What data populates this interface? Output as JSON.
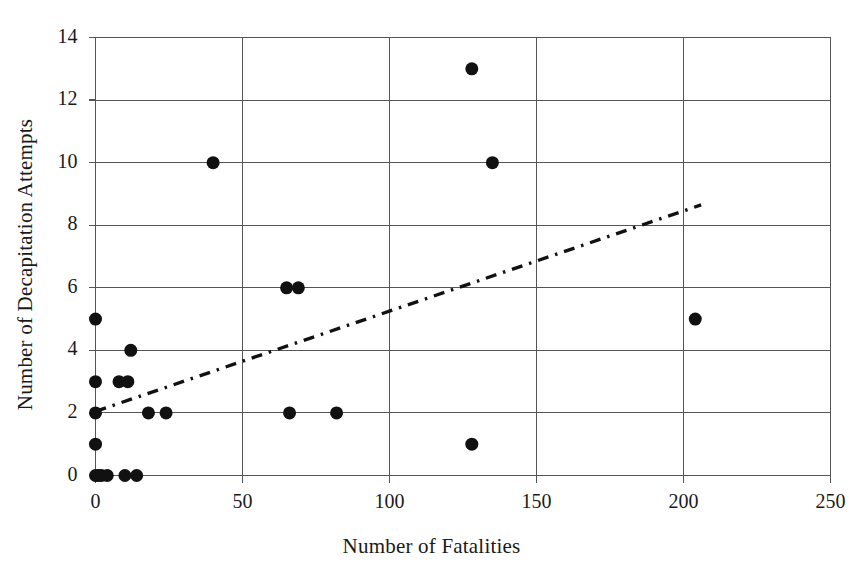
{
  "chart_data": {
    "type": "scatter",
    "title": "",
    "xlabel": "Number of Fatalities",
    "ylabel": "Number of Decapitation Attempts",
    "xlim": [
      0,
      250
    ],
    "ylim": [
      0,
      14
    ],
    "xticks": [
      0,
      50,
      100,
      150,
      200,
      250
    ],
    "yticks": [
      0,
      2,
      4,
      6,
      8,
      10,
      12,
      14
    ],
    "xtick_labels": [
      "0",
      "50",
      "100",
      "150",
      "200",
      "250"
    ],
    "ytick_labels": [
      "0",
      "2",
      "4",
      "6",
      "8",
      "10",
      "12",
      "14"
    ],
    "grid": true,
    "grid_color": "#555555",
    "legend": "none",
    "marker": {
      "shape": "circle",
      "color": "#111111",
      "size_px": 13
    },
    "points": [
      {
        "x": 0,
        "y": 0
      },
      {
        "x": 1,
        "y": 0
      },
      {
        "x": 2,
        "y": 0
      },
      {
        "x": 4,
        "y": 0
      },
      {
        "x": 10,
        "y": 0
      },
      {
        "x": 14,
        "y": 0
      },
      {
        "x": 0,
        "y": 1
      },
      {
        "x": 0,
        "y": 2
      },
      {
        "x": 0,
        "y": 3
      },
      {
        "x": 0,
        "y": 5
      },
      {
        "x": 8,
        "y": 3
      },
      {
        "x": 11,
        "y": 3
      },
      {
        "x": 12,
        "y": 4
      },
      {
        "x": 18,
        "y": 2
      },
      {
        "x": 24,
        "y": 2
      },
      {
        "x": 40,
        "y": 10
      },
      {
        "x": 65,
        "y": 6
      },
      {
        "x": 69,
        "y": 6
      },
      {
        "x": 66,
        "y": 2
      },
      {
        "x": 82,
        "y": 2
      },
      {
        "x": 128,
        "y": 13
      },
      {
        "x": 135,
        "y": 10
      },
      {
        "x": 128,
        "y": 1
      },
      {
        "x": 204,
        "y": 5
      }
    ],
    "trendline": {
      "style": "dash-dot",
      "color": "#111111",
      "x_start": 0,
      "y_start": 2.05,
      "x_end": 206,
      "y_end": 8.65
    }
  },
  "axes": {
    "x_title": "Number of Fatalities",
    "y_title": "Number of Decapitation Attempts"
  }
}
